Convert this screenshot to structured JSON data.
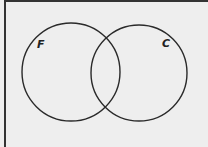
{
  "diagram": {
    "type": "venn",
    "sets": [
      {
        "label": "F",
        "cx": 71,
        "cy": 72,
        "r": 49
      },
      {
        "label": "C",
        "cx": 139,
        "cy": 73,
        "r": 48
      }
    ],
    "colors": {
      "background": "#eeeeee",
      "stroke": "#2a2a2a",
      "border": "#333333"
    }
  }
}
